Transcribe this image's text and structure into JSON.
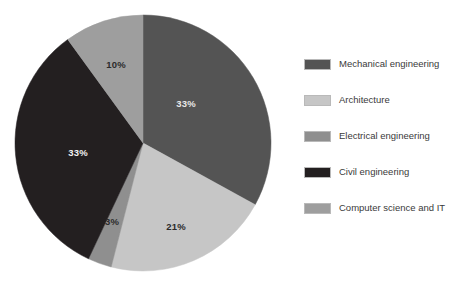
{
  "chart_data": {
    "type": "pie",
    "title": "",
    "subtitle": "",
    "xlabel": "",
    "ylabel": "",
    "legend_position": "right",
    "grid": false,
    "start_angle_deg": 0,
    "direction": "clockwise",
    "categories": [
      "Mechanical engineering",
      "Architecture",
      "Electrical engineering",
      "Civil engineering",
      "Computer science and IT"
    ],
    "values": [
      33,
      21,
      3,
      33,
      10
    ],
    "data_labels": [
      "33%",
      "21%",
      "3%",
      "33%",
      "10%"
    ],
    "colors": [
      "#545454",
      "#c6c6c6",
      "#8f8f8f",
      "#231f20",
      "#9e9e9e"
    ],
    "label_colors": [
      "#e8e8e8",
      "#2b2b2b",
      "#2b2b2b",
      "#f2f2f2",
      "#2b2b2b"
    ],
    "slices": [
      {
        "name": "Mechanical engineering",
        "value": 33,
        "label": "33%",
        "color": "#545454",
        "label_color": "#e8e8e8",
        "label_x": 186,
        "label_y": 104
      },
      {
        "name": "Architecture",
        "value": 21,
        "label": "21%",
        "color": "#c6c6c6",
        "label_color": "#2b2b2b",
        "label_x": 176,
        "label_y": 227
      },
      {
        "name": "Electrical engineering",
        "value": 3,
        "label": "3%",
        "color": "#8f8f8f",
        "label_color": "#2b2b2b",
        "label_x": 112,
        "label_y": 222
      },
      {
        "name": "Civil engineering",
        "value": 33,
        "label": "33%",
        "color": "#231f20",
        "label_color": "#f2f2f2",
        "label_x": 78,
        "label_y": 153
      },
      {
        "name": "Computer science and IT",
        "value": 10,
        "label": "10%",
        "color": "#9e9e9e",
        "label_color": "#2b2b2b",
        "label_x": 116,
        "label_y": 65
      }
    ],
    "geometry": {
      "center_x": 143,
      "center_y": 143,
      "radius": 128
    }
  },
  "legend": {
    "items": [
      {
        "label": "Mechanical engineering",
        "color": "#545454"
      },
      {
        "label": "Architecture",
        "color": "#c6c6c6"
      },
      {
        "label": "Electrical engineering",
        "color": "#8f8f8f"
      },
      {
        "label": "Civil engineering",
        "color": "#231f20"
      },
      {
        "label": "Computer science and IT",
        "color": "#9e9e9e"
      }
    ]
  }
}
